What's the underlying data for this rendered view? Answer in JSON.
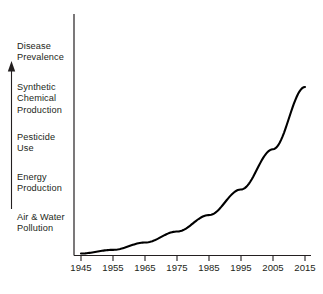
{
  "chart_data": {
    "type": "line",
    "title": "",
    "xlabel": "",
    "ylabel": "",
    "x_tick_labels": [
      "1945",
      "1955",
      "1965",
      "1975",
      "1985",
      "1995",
      "2005",
      "2015"
    ],
    "x": [
      1945,
      1955,
      1965,
      1975,
      1985,
      1995,
      2005,
      2015
    ],
    "xlim": [
      1945,
      2015
    ],
    "ylim": [
      0,
      100
    ],
    "grid": false,
    "legend": null,
    "y_axis_categories": [
      "Disease\nPrevalence",
      "Synthetic\nChemical\nProduction",
      "Pesticide\nUse",
      "Energy\nProduction",
      "Air & Water\nPollution"
    ],
    "y_axis_direction": "increasing-upward",
    "series": [
      {
        "name": "Growth trend",
        "values": [
          1,
          3,
          7,
          13,
          22,
          36,
          58,
          92
        ],
        "color": "#000000",
        "style": "solid",
        "width": 2
      }
    ],
    "annotations": [
      {
        "name": "upward-trend-arrow",
        "description": "Vertical arrow pointing up beside the stacked category labels"
      }
    ]
  },
  "colors": {
    "background": "#ffffff",
    "axis": "#231f20",
    "curve": "#000000",
    "text": "#231f20"
  }
}
